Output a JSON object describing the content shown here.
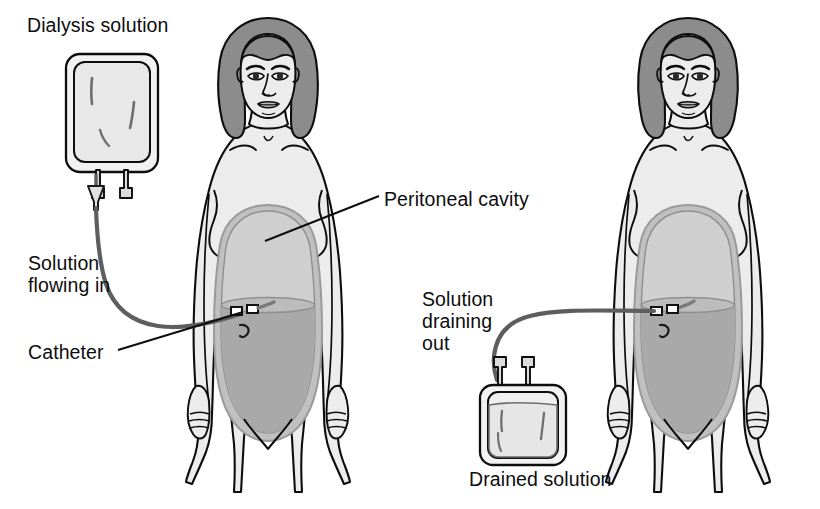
{
  "figure": {
    "background_color": "#ffffff"
  },
  "labels": {
    "dialysis_solution": "Dialysis solution",
    "solution_flowing_in": "Solution\nflowing in",
    "catheter": "Catheter",
    "peritoneal_cavity": "Peritoneal cavity",
    "solution_draining_out": "Solution\ndraining\nout",
    "drained_solution": "Drained solution"
  },
  "panels": [
    {
      "id": "left",
      "name": "infusion-panel",
      "stage": "Solution flowing in",
      "bag": {
        "name": "dialysis-solution-bag",
        "position": "hanging above",
        "state": "full",
        "ports": 2,
        "drip_chamber": true
      },
      "labels": [
        "Dialysis solution",
        "Solution flowing in",
        "Catheter",
        "Peritoneal cavity"
      ]
    },
    {
      "id": "right",
      "name": "drainage-panel",
      "stage": "Solution draining out",
      "bag": {
        "name": "drained-solution-bag",
        "position": "below at waist level",
        "state": "filling",
        "ports": 2,
        "drip_chamber": false
      },
      "labels": [
        "Solution draining out",
        "Drained solution"
      ]
    }
  ],
  "colors": {
    "outline": "#0d0d0d",
    "skin": "#ececec",
    "hair": "#8c8c8c",
    "cavity_upper": "#c8c8c8",
    "cavity_fluid": "#a8a8a8",
    "cavity_rim": "#9a9a9a",
    "bag_fill": "#efefef",
    "tube": "#5e5e5e",
    "text": "#0d0d0d"
  },
  "anatomy": {
    "body_parts": [
      "head",
      "hair",
      "face",
      "eyes",
      "nose",
      "mouth",
      "neck",
      "clavicle",
      "shoulders",
      "breasts",
      "arms",
      "hands",
      "abdomen",
      "legs"
    ],
    "cavity_parts": [
      "peritoneal membrane rim",
      "upper space",
      "dialysate fluid",
      "fluid level line"
    ],
    "catheter_parts": [
      "tube",
      "connector clamp",
      "connector clamp",
      "catheter tip",
      "navel"
    ]
  }
}
